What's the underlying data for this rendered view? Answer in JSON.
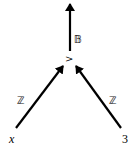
{
  "diagram": {
    "kind": "expression-tree",
    "root": {
      "label": ">",
      "output_type": "𝔹"
    },
    "children": [
      {
        "label": "x",
        "edge_type": "ℤ",
        "italic": true
      },
      {
        "label": "3",
        "edge_type": "ℤ",
        "italic": false
      }
    ],
    "colors": {
      "stroke": "#000000",
      "background": "#ffffff"
    }
  }
}
